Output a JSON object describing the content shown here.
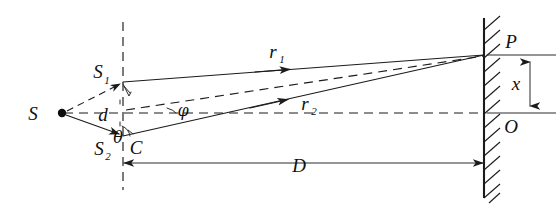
{
  "figure": {
    "background_color": "#ffffff",
    "ink_color": "#1b1b1b",
    "width": 556,
    "height": 211
  },
  "labels": {
    "source": "S",
    "slit_upper": "S",
    "slit_upper_sub": "1",
    "slit_lower": "S",
    "slit_lower_sub": "2",
    "slit_separation": "d",
    "slit_midpoint": "C",
    "angle_theta": "θ",
    "angle_phi": "φ",
    "ray_upper": "r",
    "ray_upper_sub": "1",
    "ray_lower": "r",
    "ray_lower_sub": "2",
    "screen_point": "P",
    "screen_center": "O",
    "fringe_position": "x",
    "distance_to_screen": "D"
  },
  "geometry": {
    "source_point": {
      "x": 62,
      "y": 113
    },
    "slit_upper_point": {
      "x": 123,
      "y": 82
    },
    "slit_lower_point": {
      "x": 123,
      "y": 136
    },
    "slit_plane_x": 123,
    "screen_x": 484,
    "axis_y": 113,
    "screen_point_p": {
      "x": 484,
      "y": 55
    },
    "screen_point_o": {
      "x": 484,
      "y": 113
    },
    "distance_arrow_y": 163
  },
  "elements": {
    "slit_plane": "vertical-dashed-line",
    "optical_axis": "horizontal-dashed-line",
    "screen": "hatched-vertical-barrier",
    "ray_s_to_s1": "dashed-arrow",
    "ray_s_to_s2": "solid-arrow",
    "ray_r1": "solid-arrow-to-P",
    "ray_r2": "solid-arrow-to-P",
    "bisector": "dashed-line-from-C-to-P",
    "path_difference_marker": "right-angle-tick-at-S1",
    "fringe_measure": "double-headed-vertical-arrow",
    "screen_distance": "double-headed-horizontal-arrow"
  }
}
